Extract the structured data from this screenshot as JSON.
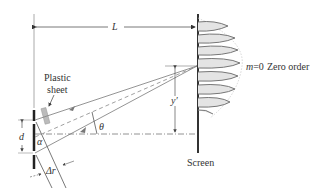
{
  "diagram": {
    "labels": {
      "distance_L": "L",
      "plastic_sheet_line1": "Plastic",
      "plastic_sheet_line2": "sheet",
      "slit_separation": "d",
      "angle_alpha": "α",
      "angle_theta": "θ",
      "path_difference": "Δr",
      "fringe_position": "y′",
      "order_m": "m",
      "order_eq": "=0",
      "zero_order": "Zero order",
      "screen": "Screen"
    },
    "colors": {
      "line": "#555555",
      "ray": "#888888",
      "barrier": "#222222",
      "screen": "#333333",
      "sheet": "#bbbbbb",
      "fringe": "#777777",
      "envelope": "#cccccc",
      "text": "#333333"
    }
  }
}
